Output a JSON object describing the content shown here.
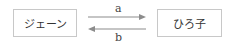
{
  "diagram": {
    "nodes": [
      {
        "id": "left",
        "label": "ジェーン"
      },
      {
        "id": "right",
        "label": "ひろ子"
      }
    ],
    "edges": [
      {
        "from": "left",
        "to": "right",
        "label": "a"
      },
      {
        "from": "right",
        "to": "left",
        "label": "b"
      }
    ],
    "colors": {
      "arrow": "#8c8c8c",
      "box_border": "#c8c8c8"
    }
  }
}
